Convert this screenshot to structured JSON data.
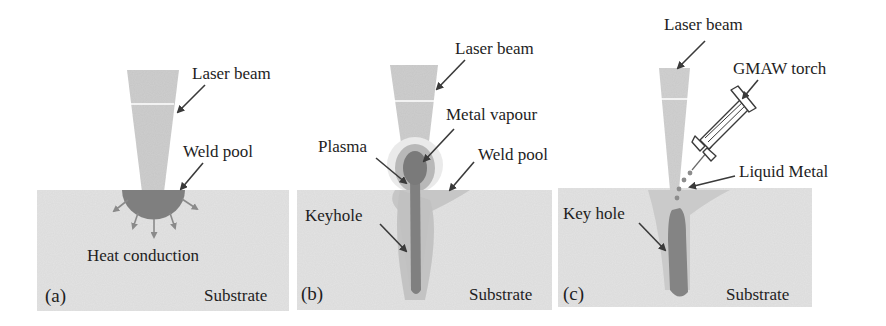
{
  "figure": {
    "colors": {
      "background": "#ffffff",
      "substrate": "#e4e4e4",
      "beam": "#cfcfcf",
      "weld_pool_light": "#c2c2c2",
      "weld_pool_dark": "#7d7d7d",
      "keyhole": "#808080",
      "plasma": "#b5b5b5",
      "arrow": "#3a3a3a",
      "heat_arrow": "#8a8a8a",
      "text": "#1e1e1e"
    }
  },
  "panels": [
    {
      "id": "a",
      "tag": "(a)",
      "labels": {
        "laser_beam": "Laser beam",
        "weld_pool": "Weld pool",
        "heat_conduction": "Heat conduction",
        "substrate": "Substrate"
      }
    },
    {
      "id": "b",
      "tag": "(b)",
      "labels": {
        "laser_beam": "Laser beam",
        "metal_vapour": "Metal vapour",
        "plasma": "Plasma",
        "weld_pool": "Weld pool",
        "keyhole": "Keyhole",
        "substrate": "Substrate"
      }
    },
    {
      "id": "c",
      "tag": "(c)",
      "labels": {
        "laser_beam": "Laser beam",
        "gmaw_torch": "GMAW torch",
        "liquid_metal": "Liquid Metal",
        "key_hole": "Key hole",
        "substrate": "Substrate"
      }
    }
  ]
}
